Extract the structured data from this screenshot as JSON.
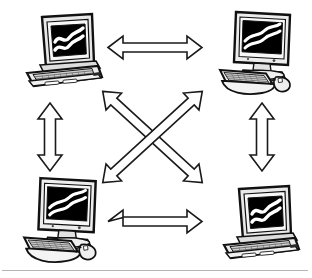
{
  "figure": {
    "kind": "network-diagram",
    "title": "Peer-to-peer computer network",
    "background_color": "#ffffff",
    "stroke_color": "#000000",
    "screen_color": "#000000",
    "screen_wave_color": "#ffffff",
    "case_color": "#f2f2f2",
    "case_shade_color": "#c9c9c9",
    "width": 312,
    "height": 278,
    "baseline_rule_color": "#b5b5b5"
  },
  "nodes": [
    {
      "id": "node-top-left",
      "label": "Laptop computer",
      "device_type": "laptop",
      "position": "top-left",
      "screen_graphic": "wave-chart"
    },
    {
      "id": "node-top-right",
      "label": "Desktop computer",
      "device_type": "desktop",
      "position": "top-right",
      "screen_graphic": "wave-chart"
    },
    {
      "id": "node-bottom-left",
      "label": "Desktop computer",
      "device_type": "desktop",
      "position": "bottom-left",
      "screen_graphic": "wave-chart"
    },
    {
      "id": "node-bottom-right",
      "label": "Laptop computer",
      "device_type": "laptop",
      "position": "bottom-right",
      "screen_graphic": "wave-chart"
    }
  ],
  "connections": [
    {
      "id": "link-top",
      "label": "Top-left to top-right link",
      "from": "node-top-left",
      "to": "node-top-right",
      "orientation": "horizontal",
      "arrow_style": "double-headed-outline"
    },
    {
      "id": "link-bottom",
      "label": "Bottom-left to bottom-right link",
      "from": "node-bottom-left",
      "to": "node-bottom-right",
      "orientation": "horizontal",
      "arrow_style": "double-headed-outline"
    },
    {
      "id": "link-left",
      "label": "Top-left to bottom-left link",
      "from": "node-top-left",
      "to": "node-bottom-left",
      "orientation": "vertical",
      "arrow_style": "double-headed-outline"
    },
    {
      "id": "link-right",
      "label": "Top-right to bottom-right link",
      "from": "node-top-right",
      "to": "node-bottom-right",
      "orientation": "vertical",
      "arrow_style": "double-headed-outline"
    },
    {
      "id": "link-diagonal-nwse",
      "label": "Top-left to bottom-right link",
      "from": "node-top-left",
      "to": "node-bottom-right",
      "orientation": "diagonal-nw-se",
      "arrow_style": "double-headed-outline"
    },
    {
      "id": "link-diagonal-nesw",
      "label": "Top-right to bottom-left link",
      "from": "node-top-right",
      "to": "node-bottom-left",
      "orientation": "diagonal-ne-sw",
      "arrow_style": "double-headed-outline"
    }
  ]
}
